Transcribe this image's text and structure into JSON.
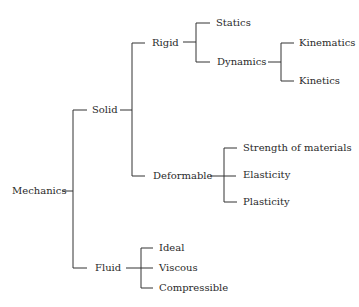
{
  "diagram": {
    "root": {
      "label": "Mechanics",
      "children": [
        {
          "label": "Solid",
          "children": [
            {
              "label": "Rigid",
              "children": [
                {
                  "label": "Statics"
                },
                {
                  "label": "Dynamics",
                  "children": [
                    {
                      "label": "Kinematics"
                    },
                    {
                      "label": "Kinetics"
                    }
                  ]
                }
              ]
            },
            {
              "label": "Deformable",
              "children": [
                {
                  "label": "Strength of materials"
                },
                {
                  "label": "Elasticity"
                },
                {
                  "label": "Plasticity"
                }
              ]
            }
          ]
        },
        {
          "label": "Fluid",
          "children": [
            {
              "label": "Ideal"
            },
            {
              "label": "Viscous"
            },
            {
              "label": "Compressible"
            }
          ]
        }
      ]
    },
    "colors": {
      "line": "#333333",
      "text": "#2a2a2a",
      "background": "#ffffff"
    }
  }
}
